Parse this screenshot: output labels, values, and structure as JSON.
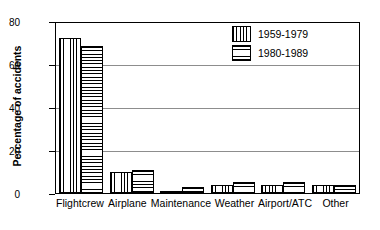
{
  "chart_data": {
    "type": "bar",
    "title": "",
    "xlabel": "",
    "ylabel": "Percentage of accidents",
    "ylim": [
      0,
      80
    ],
    "yticks": [
      0,
      20,
      40,
      60,
      80
    ],
    "ytick_labels": [
      "0",
      "20",
      "40",
      "60",
      "80"
    ],
    "grid": true,
    "legend_position": "top-right",
    "categories": [
      "Flightcrew",
      "Airplane",
      "Maintenance",
      "Weather",
      "Airport/ATC",
      "Other"
    ],
    "series": [
      {
        "name": "1959-1979",
        "pattern": "vertical-hatch",
        "values": [
          73,
          10,
          1,
          4,
          4,
          4
        ]
      },
      {
        "name": "1980-1989",
        "pattern": "horizontal-hatch",
        "values": [
          69,
          11,
          3,
          5,
          5,
          4
        ]
      }
    ]
  },
  "legend": {
    "items": [
      {
        "label": "1959-1979",
        "pattern": "vertical-hatch"
      },
      {
        "label": "1980-1989",
        "pattern": "horizontal-hatch"
      }
    ]
  },
  "colors": {
    "axis": "#000000",
    "gridline": "#8d8d8d",
    "background": "#ffffff",
    "hatch": "#000000"
  }
}
